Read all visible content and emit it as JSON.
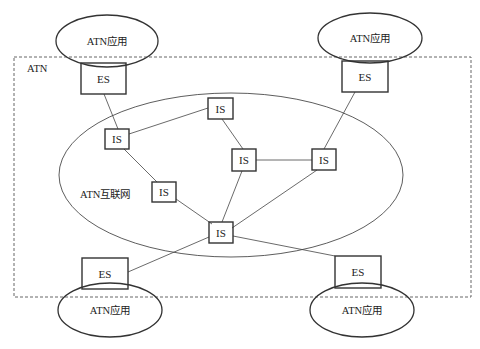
{
  "diagram": {
    "boundary_label": "ATN",
    "internet_label": "ATN互联网",
    "applications": [
      {
        "id": "app-top-left",
        "label": "ATN应用"
      },
      {
        "id": "app-top-right",
        "label": "ATN应用"
      },
      {
        "id": "app-bottom-left",
        "label": "ATN应用"
      },
      {
        "id": "app-bottom-right",
        "label": "ATN应用"
      }
    ],
    "nodes": [
      {
        "id": "es-top-left",
        "type": "end-system",
        "label": "ES"
      },
      {
        "id": "es-top-right",
        "type": "end-system",
        "label": "ES"
      },
      {
        "id": "es-bottom-left",
        "type": "end-system",
        "label": "ES"
      },
      {
        "id": "es-bottom-right",
        "type": "end-system",
        "label": "ES"
      },
      {
        "id": "is-left",
        "type": "intermediate-system",
        "label": "IS"
      },
      {
        "id": "is-top",
        "type": "intermediate-system",
        "label": "IS"
      },
      {
        "id": "is-center",
        "type": "intermediate-system",
        "label": "IS"
      },
      {
        "id": "is-right",
        "type": "intermediate-system",
        "label": "IS"
      },
      {
        "id": "is-lower-left",
        "type": "intermediate-system",
        "label": "IS"
      },
      {
        "id": "is-bottom",
        "type": "intermediate-system",
        "label": "IS"
      }
    ],
    "links": [
      [
        "es-top-left",
        "is-left"
      ],
      [
        "is-left",
        "is-top"
      ],
      [
        "is-left",
        "is-lower-left"
      ],
      [
        "is-top",
        "is-center"
      ],
      [
        "is-center",
        "is-right"
      ],
      [
        "is-right",
        "es-top-right"
      ],
      [
        "is-center",
        "is-bottom"
      ],
      [
        "is-right",
        "is-bottom"
      ],
      [
        "is-lower-left",
        "is-bottom"
      ],
      [
        "is-bottom",
        "es-bottom-left"
      ],
      [
        "is-bottom",
        "es-bottom-right"
      ]
    ]
  }
}
